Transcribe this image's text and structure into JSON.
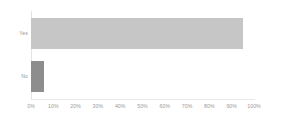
{
  "chart_data": {
    "type": "bar",
    "orientation": "horizontal",
    "title": "",
    "subtitle": "",
    "xlabel": "",
    "ylabel": "",
    "categories": [
      "Yes",
      "No"
    ],
    "values": [
      95,
      6
    ],
    "value_suffix": "%",
    "xlim": [
      0,
      100
    ],
    "xticks": [
      0,
      10,
      20,
      30,
      40,
      50,
      60,
      70,
      80,
      90,
      100
    ],
    "xtick_labels": [
      "0%",
      "10%",
      "20%",
      "30%",
      "40%",
      "50%",
      "60%",
      "70%",
      "80%",
      "90%",
      "100%"
    ],
    "grid": false,
    "legend": false,
    "legend_position": "none",
    "series": [
      {
        "name": "",
        "values": [
          95,
          6
        ],
        "colors": [
          "#c6c6c6",
          "#8d8d8d"
        ]
      }
    ],
    "bar_colors": {
      "yes": "#c6c6c6",
      "no": "#8d8d8d"
    },
    "axis_color": "#e3e3e3",
    "tick_label_color": "#9a9a9a",
    "background": "#ffffff"
  }
}
